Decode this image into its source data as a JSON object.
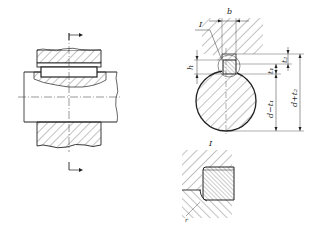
{
  "figure": {
    "type": "engineering-drawing",
    "views": {
      "longitudinal_section": {
        "description": "shaft with key in hub, section arrows"
      },
      "cross_section": {
        "labels": {
          "detail": "I",
          "width": "b",
          "height": "h",
          "hub_depth": "t₂",
          "shaft_depth": "t₁",
          "shaft_dim": "d−t₁",
          "hub_dim": "d+t₂"
        }
      },
      "detail_view": {
        "label": "I"
      }
    },
    "colors": {
      "line": "#222222",
      "background": "#ffffff"
    }
  }
}
